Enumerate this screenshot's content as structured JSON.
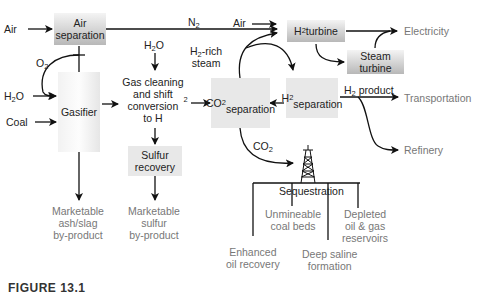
{
  "inputs": {
    "air_left": "Air",
    "water": "H2O",
    "coal": "Coal",
    "air_turbine": "Air"
  },
  "streams": {
    "o2": "O2",
    "n2": "N2",
    "h2o_top": "H2O",
    "h2_rich_steam_1": "H2-rich",
    "h2_rich_steam_2": "steam",
    "co2": "CO2",
    "h2_product": "H2 product"
  },
  "nodes": {
    "air_separation": [
      "Air",
      "separation"
    ],
    "gasifier": "Gasifier",
    "gas_cleaning": [
      "Gas cleaning",
      "and shift",
      "conversion",
      "to H2"
    ],
    "sulfur_recovery": [
      "Sulfur",
      "recovery"
    ],
    "co2_separation": [
      "CO2",
      "separation"
    ],
    "h2_separation": [
      "H2",
      "separation"
    ],
    "h2_turbine": "H2 turbine",
    "steam_turbine": [
      "Steam",
      "turbine"
    ],
    "sequestration": "Sequestration"
  },
  "outputs": {
    "electricity": "Electricity",
    "transportation": "Transportation",
    "refinery": "Refinery",
    "ash_slag": [
      "Marketable",
      "ash/slag",
      "by-product"
    ],
    "sulfur": [
      "Marketable",
      "sulfur",
      "by-product"
    ]
  },
  "sequestration_options": {
    "enhanced_oil": [
      "Enhanced",
      "oil recovery"
    ],
    "coal_beds": [
      "Unmineable",
      "coal beds"
    ],
    "deep_saline": [
      "Deep saline",
      "formation"
    ],
    "depleted": [
      "Depleted",
      "oil & gas",
      "reservoirs"
    ]
  },
  "caption": "FIGURE 13.1"
}
